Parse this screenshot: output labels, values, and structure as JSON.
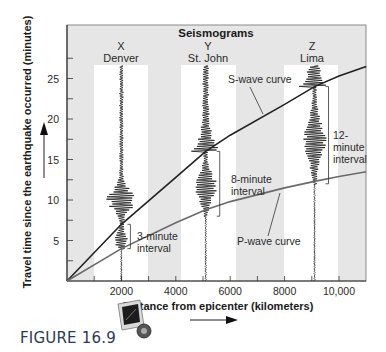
{
  "title": "Seismograms",
  "figure_label": "FIGURE 16.9",
  "icon": "media-icon",
  "axes": {
    "xlabel": "Distance from epicenter (kilometers)",
    "ylabel": "Travel time since the earthquake occurred (minutes)",
    "x_ticks": [
      {
        "value": 2000,
        "label": "2000"
      },
      {
        "value": 4000,
        "label": "4000"
      },
      {
        "value": 6000,
        "label": "6000"
      },
      {
        "value": 8000,
        "label": "8000"
      },
      {
        "value": 10000,
        "label": "10,000"
      }
    ],
    "y_ticks": [
      {
        "value": 5,
        "label": "5"
      },
      {
        "value": 10,
        "label": "10"
      },
      {
        "value": 15,
        "label": "15"
      },
      {
        "value": 20,
        "label": "20"
      },
      {
        "value": 25,
        "label": "25"
      }
    ]
  },
  "stations": [
    {
      "letter": "X",
      "name": "Denver",
      "distance_km": 2000
    },
    {
      "letter": "Y",
      "name": "St. John",
      "distance_km": 5100
    },
    {
      "letter": "Z",
      "name": "Lima",
      "distance_km": 9100
    }
  ],
  "curves": [
    {
      "name": "S-wave curve",
      "label": "S-wave curve"
    },
    {
      "name": "P-wave curve",
      "label": "P-wave curve"
    }
  ],
  "intervals": [
    {
      "label_line1": "3-minute",
      "label_line2": "interval",
      "station": "Denver"
    },
    {
      "label_line1": "8-minute",
      "label_line2": "interval",
      "station": "St. John"
    },
    {
      "label_line1": "12-",
      "label_line2": "minute",
      "label_line3": "interval",
      "station": "Lima"
    }
  ],
  "chart_data": {
    "type": "line",
    "title": "Seismograms",
    "xlabel": "Distance from epicenter (kilometers)",
    "ylabel": "Travel time since the earthquake occurred (minutes)",
    "xlim": [
      0,
      11000
    ],
    "ylim": [
      0,
      29
    ],
    "grid": false,
    "series": [
      {
        "name": "S-wave curve",
        "x": [
          0,
          2000,
          4000,
          5100,
          6000,
          8000,
          9100,
          10000,
          11000
        ],
        "y": [
          0,
          7.0,
          12.8,
          16.0,
          18.0,
          21.8,
          24.0,
          25.3,
          26.5
        ]
      },
      {
        "name": "P-wave curve",
        "x": [
          0,
          2000,
          4000,
          5100,
          6000,
          8000,
          9100,
          10000,
          11000
        ],
        "y": [
          0,
          4.0,
          7.2,
          8.8,
          9.8,
          11.5,
          12.3,
          12.9,
          13.5
        ]
      }
    ],
    "stations": [
      {
        "name": "Denver",
        "letter": "X",
        "distance_km": 2000,
        "p_arrival": 4,
        "s_arrival": 7,
        "interval_min": 3
      },
      {
        "name": "St. John",
        "letter": "Y",
        "distance_km": 5100,
        "p_arrival": 8,
        "s_arrival": 16,
        "interval_min": 8
      },
      {
        "name": "Lima",
        "letter": "Z",
        "distance_km": 9100,
        "p_arrival": 12,
        "s_arrival": 24,
        "interval_min": 12
      }
    ]
  }
}
